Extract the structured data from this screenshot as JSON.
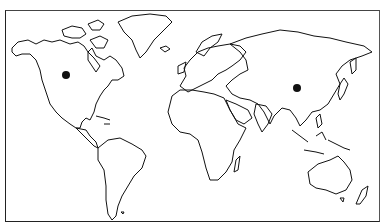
{
  "map": {
    "type": "world-outline",
    "frame": {
      "x": 5,
      "y": 10,
      "width": 375,
      "height": 212
    },
    "stroke_color": "#111111",
    "background_color": "#ffffff",
    "markers": [
      {
        "name": "north-america-marker",
        "region": "North America (western Canada/US)",
        "x": 66,
        "y": 75,
        "r": 4,
        "color": "#111111"
      },
      {
        "name": "asia-marker",
        "region": "East Asia (China)",
        "x": 297,
        "y": 88,
        "r": 4,
        "color": "#111111"
      }
    ]
  }
}
